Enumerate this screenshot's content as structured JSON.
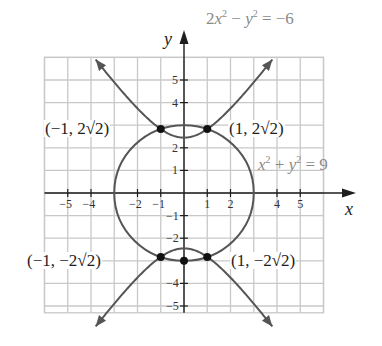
{
  "chart_data": {
    "type": "line",
    "title": "",
    "xlabel": "x",
    "ylabel": "y",
    "xlim": [
      -6,
      6
    ],
    "ylim": [
      -5.3,
      6
    ],
    "grid": true,
    "x_ticks": [
      -5,
      -4,
      -2,
      -1,
      1,
      2,
      4,
      5
    ],
    "y_ticks": [
      5,
      4,
      2,
      1,
      -1,
      -2,
      -4,
      -5
    ],
    "x_tick_labels": [
      "−5",
      "−4",
      "−2",
      "−1",
      "1",
      "2",
      "4",
      "5"
    ],
    "y_tick_labels": [
      "5",
      "4",
      "2",
      "1",
      "−1",
      "−2",
      "−4",
      "−5"
    ],
    "series": [
      {
        "name": "2x² − y² = −6",
        "kind": "hyperbola",
        "equation": "2x^2 - y^2 = -6",
        "x_range": [
          -3.8,
          3.8
        ],
        "branches": [
          "upper",
          "lower"
        ],
        "arrows_at_ends": true,
        "color": "#555555"
      },
      {
        "name": "x² + y² = 9",
        "kind": "circle",
        "equation": "x^2 + y^2 = 9",
        "center": [
          0,
          0
        ],
        "radius": 3,
        "color": "#555555"
      }
    ],
    "points": [
      {
        "x": -1,
        "y": 2.828,
        "label": "(−1, 2√2)"
      },
      {
        "x": 1,
        "y": 2.828,
        "label": "(1, 2√2)"
      },
      {
        "x": -1,
        "y": -2.828,
        "label": "(−1, −2√2)"
      },
      {
        "x": 1,
        "y": -2.828,
        "label": "(1, −2√2)"
      },
      {
        "x": 0,
        "y": -3,
        "label": ""
      }
    ],
    "annotations": [
      "2x² − y² = −6",
      "x² + y² = 9"
    ]
  },
  "labels": {
    "y_axis": "y",
    "x_axis": "x",
    "hyperbola_eq": {
      "a": "2",
      "b": "x",
      "c": "2",
      "d": " − ",
      "e": "y",
      "f": "2",
      "g": " = −6"
    },
    "circle_eq": {
      "a": "x",
      "b": "2",
      "c": " + ",
      "d": "y",
      "e": "2",
      "f": " = 9"
    },
    "p1": "(−1, 2√2)",
    "p2": "(1, 2√2)",
    "p3": "(−1, −2√2)",
    "p4": "(1, −2√2)"
  },
  "colors": {
    "grid": "#c8c8c8",
    "axis": "#1e1e1e",
    "curve": "#555555",
    "point": "#111111",
    "equation_text": "#8a8a8a"
  }
}
